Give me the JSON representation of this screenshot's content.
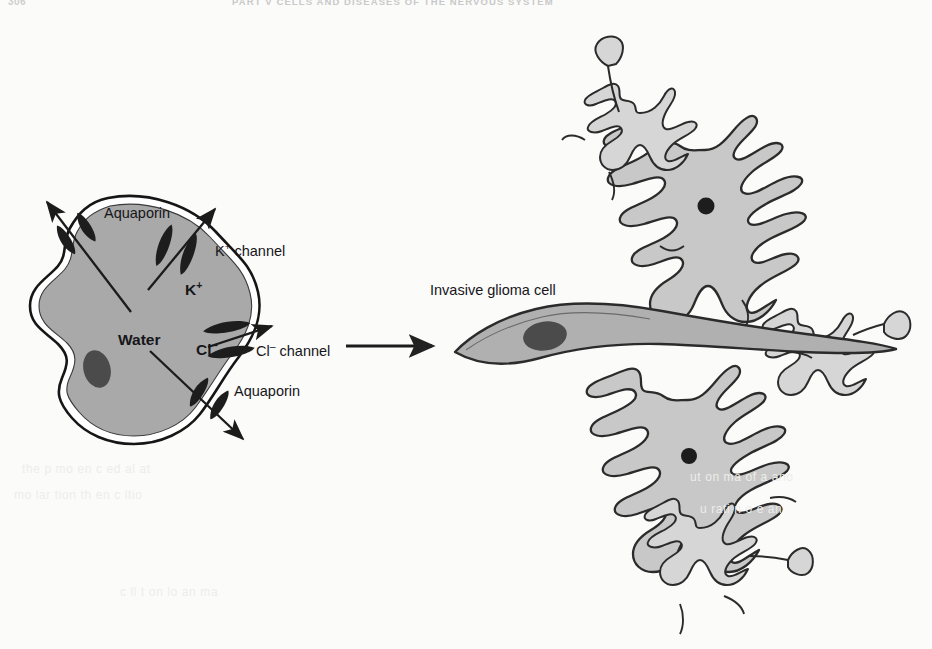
{
  "page": {
    "folio": "306",
    "running_head": "PART V  CELLS AND DISEASES OF THE NERVOUS SYSTEM",
    "background_color": "#fbfbfa"
  },
  "figure": {
    "type": "two-panel-schematic",
    "panels": [
      {
        "id": "left",
        "name": "swelling-glioma-cell",
        "description": "Glioma cell releasing K+, Cl- and water through channels"
      },
      {
        "id": "right",
        "name": "invasion-scene",
        "description": "Invasive spindle-shaped glioma cell migrating between astrocytes"
      }
    ],
    "connector": {
      "name": "process-arrow",
      "direction": "right",
      "x1": 345,
      "y1": 346,
      "x2": 430,
      "y2": 346
    }
  },
  "left_panel": {
    "cell": {
      "name": "glioma-cell-body",
      "fill": "#a9a9a9",
      "membrane_color": "#1a1a1a",
      "nucleus": {
        "name": "nucleus",
        "fill": "#4a4a4a",
        "cx": 97,
        "cy": 369,
        "rx": 13,
        "ry": 19
      }
    },
    "interior_labels": [
      {
        "name": "water-label",
        "text": "Water",
        "plain": "Water",
        "x": 118,
        "y": 340,
        "bold": true
      },
      {
        "name": "potassium-ion-label",
        "text": "K+",
        "base": "K",
        "sup": "+",
        "x": 185,
        "y": 289,
        "bold": true
      },
      {
        "name": "chloride-ion-label",
        "text": "Cl-",
        "base": "Cl",
        "sup": "–",
        "x": 196,
        "y": 349,
        "bold": true
      }
    ],
    "callout_labels": [
      {
        "name": "aquaporin-top-label",
        "text": "Aquaporin",
        "plain": "Aquaporin",
        "x": 104,
        "y": 213
      },
      {
        "name": "k-channel-label",
        "base": "K",
        "sup": "+",
        "suffix": " channel",
        "x": 215,
        "y": 251
      },
      {
        "name": "cl-channel-label",
        "base": "Cl",
        "sup": "–",
        "suffix": " channel",
        "x": 256,
        "y": 351
      },
      {
        "name": "aquaporin-bottom-label",
        "text": "Aquaporin",
        "plain": "Aquaporin",
        "x": 234,
        "y": 391
      }
    ],
    "channels": [
      {
        "name": "aquaporin-channel-top",
        "type": "aquaporin",
        "cx": 77,
        "cy": 232,
        "angle": -35
      },
      {
        "name": "k-channel-pore",
        "type": "potassium",
        "cx": 177,
        "cy": 249,
        "angle": 18
      },
      {
        "name": "cl-channel-pore",
        "type": "chloride",
        "cx": 228,
        "cy": 339,
        "angle": 78
      },
      {
        "name": "aquaporin-channel-bottom",
        "type": "aquaporin",
        "cx": 209,
        "cy": 398,
        "angle": 28
      }
    ],
    "efflux_arrows": [
      {
        "name": "water-efflux-arrow-top",
        "x1": 130,
        "y1": 310,
        "x2": 46,
        "y2": 203
      },
      {
        "name": "potassium-efflux-arrow",
        "x1": 147,
        "y1": 289,
        "x2": 214,
        "y2": 210
      },
      {
        "name": "chloride-efflux-arrow",
        "x1": 207,
        "y1": 346,
        "x2": 269,
        "y2": 327
      },
      {
        "name": "water-efflux-arrow-bottom",
        "x1": 150,
        "y1": 350,
        "x2": 242,
        "y2": 438
      }
    ]
  },
  "right_panel": {
    "glioma": {
      "name": "invasive-glioma-cell",
      "label": "Invasive glioma cell",
      "label_x": 430,
      "label_y": 290,
      "fill": "#b0b0b0",
      "nucleus": {
        "name": "glioma-nucleus",
        "fill": "#4a4a4a",
        "cx": 544,
        "cy": 335,
        "rx": 22,
        "ry": 14
      }
    },
    "astrocytes": [
      {
        "name": "astrocyte-upper",
        "cx": 705,
        "cy": 205,
        "scale": 1.0,
        "soma_fill": "#c8c8c8",
        "has_nucleus": true
      },
      {
        "name": "astrocyte-lower",
        "cx": 688,
        "cy": 455,
        "scale": 1.0,
        "soma_fill": "#c8c8c8",
        "has_nucleus": true
      },
      {
        "name": "astrocyte-top-small",
        "cx": 640,
        "cy": 140,
        "scale": 0.62,
        "soma_fill": "#d6d6d6",
        "has_nucleus": false
      },
      {
        "name": "astrocyte-right-small",
        "cx": 818,
        "cy": 365,
        "scale": 0.62,
        "soma_fill": "#d6d6d6",
        "has_nucleus": false
      },
      {
        "name": "astrocyte-bottom-small",
        "cx": 700,
        "cy": 555,
        "scale": 0.62,
        "soma_fill": "#d6d6d6",
        "has_nucleus": false
      }
    ],
    "endfeet": [
      {
        "name": "endfoot-top",
        "cx": 607,
        "cy": 48
      },
      {
        "name": "endfoot-right",
        "cx": 893,
        "cy": 320
      },
      {
        "name": "endfoot-lower",
        "cx": 800,
        "cy": 560
      }
    ]
  },
  "ghost_text": [
    {
      "text": "the p  mo     en c     ed  al  at",
      "x": 22,
      "y": 462
    },
    {
      "text": "mo   lar    tion     th  en c    ltio",
      "x": 14,
      "y": 488
    },
    {
      "text": "c  ll  t  on   lo  an    ma",
      "x": 120,
      "y": 585
    },
    {
      "text": "ut  on   ma  of  a   ano",
      "x": 690,
      "y": 470
    },
    {
      "text": "u   rati  n  o        e  an",
      "x": 700,
      "y": 502
    }
  ]
}
